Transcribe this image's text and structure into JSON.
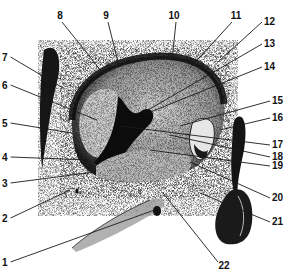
{
  "figure": {
    "type": "anatomical-stipple-illustration",
    "colors": {
      "ink": "#111111",
      "paper": "#ffffff",
      "stipple": "#2a2a2a"
    },
    "labels": [
      {
        "id": "1",
        "text": "1"
      },
      {
        "id": "2",
        "text": "2"
      },
      {
        "id": "3",
        "text": "3"
      },
      {
        "id": "4",
        "text": "4"
      },
      {
        "id": "5",
        "text": "5"
      },
      {
        "id": "6",
        "text": "6"
      },
      {
        "id": "7",
        "text": "7"
      },
      {
        "id": "8",
        "text": "8"
      },
      {
        "id": "9",
        "text": "9"
      },
      {
        "id": "10",
        "text": "10"
      },
      {
        "id": "11",
        "text": "11"
      },
      {
        "id": "12",
        "text": "12"
      },
      {
        "id": "13",
        "text": "13"
      },
      {
        "id": "14",
        "text": "14"
      },
      {
        "id": "15",
        "text": "15"
      },
      {
        "id": "16",
        "text": "16"
      },
      {
        "id": "17",
        "text": "17"
      },
      {
        "id": "18",
        "text": "18"
      },
      {
        "id": "19",
        "text": "19"
      },
      {
        "id": "20",
        "text": "20"
      },
      {
        "id": "21",
        "text": "21"
      },
      {
        "id": "22",
        "text": "22"
      }
    ]
  }
}
